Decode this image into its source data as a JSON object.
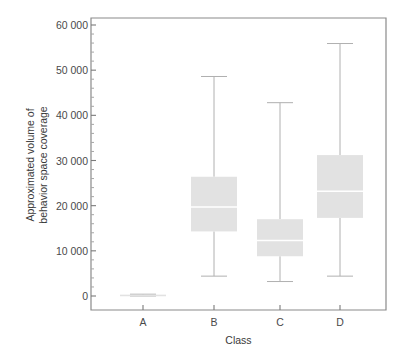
{
  "chart_data": {
    "type": "box",
    "title": "",
    "xlabel": "Class",
    "ylabel_line1": "Approximated volume of",
    "ylabel_line2": "behavior space coverage",
    "categories": [
      "A",
      "B",
      "C",
      "D"
    ],
    "ytick_labels": [
      "0",
      "10 000",
      "20 000",
      "30 000",
      "40 000",
      "50 000",
      "60 000"
    ],
    "ytick_values": [
      0,
      10000,
      20000,
      30000,
      40000,
      50000,
      60000
    ],
    "ylim": [
      -3000,
      62000
    ],
    "grid": false,
    "legend": "none",
    "minor_ticks": true,
    "box_fill": "#e2e2e2",
    "median_color": "#ffffff",
    "whisker_color": "#b0b0b0",
    "frame_color": "#8a8a8a",
    "boxes": [
      {
        "category": "A",
        "whisker_low": 0,
        "q1": 0,
        "median": 150,
        "q3": 300,
        "whisker_high": 400
      },
      {
        "category": "B",
        "whisker_low": 4400,
        "q1": 14300,
        "median": 19700,
        "q3": 26400,
        "whisker_high": 48600
      },
      {
        "category": "C",
        "whisker_low": 3200,
        "q1": 8800,
        "median": 12300,
        "q3": 17000,
        "whisker_high": 42800
      },
      {
        "category": "D",
        "whisker_low": 4400,
        "q1": 17300,
        "median": 23200,
        "q3": 31200,
        "whisker_high": 55900
      }
    ]
  }
}
